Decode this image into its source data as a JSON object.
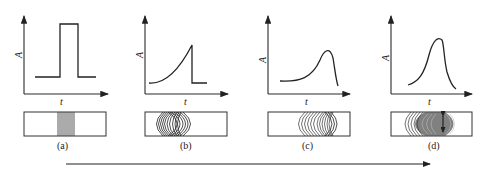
{
  "figure": {
    "axis_labels": {
      "y": "A",
      "x": "t"
    },
    "panels": [
      {
        "id": "a",
        "label": "(a)",
        "curve_shape": "rectangular pulse",
        "band": "narrow sharp band of vertical lines"
      },
      {
        "id": "b",
        "label": "(b)",
        "curve_shape": "rising exponential with sharp trailing drop",
        "band": "crescent-shaped arcs, fronting"
      },
      {
        "id": "c",
        "label": "(c)",
        "curve_shape": "asymmetric peak with tail to the front",
        "band": "broadened arcs"
      },
      {
        "id": "d",
        "label": "(d)",
        "curve_shape": "near-Gaussian broad peak",
        "band": "broad diffuse band with double-arrow marker"
      }
    ],
    "arrow": {
      "direction": "right",
      "meaning": "progression"
    }
  }
}
